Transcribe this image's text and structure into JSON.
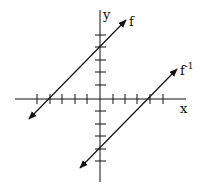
{
  "diagram": {
    "title": "",
    "axes": {
      "x_label": "x",
      "y_label": "y",
      "x_ticks": [
        -5,
        -4,
        -3,
        -2,
        -1,
        1,
        2,
        3,
        4,
        5
      ],
      "y_ticks": [
        5,
        4,
        3,
        2,
        1,
        -1,
        -2,
        -3,
        -4,
        -5
      ]
    },
    "lines": [
      {
        "name": "f",
        "label": "f",
        "label_sup": "",
        "x_intercept": -4,
        "y_intercept": 4,
        "slope": 1
      },
      {
        "name": "f_inverse",
        "label": "f",
        "label_sup": "-1",
        "x_intercept": 4,
        "y_intercept": -4,
        "slope": 1
      }
    ],
    "colors": {
      "stroke": "#111111",
      "background": "#ffffff"
    }
  }
}
